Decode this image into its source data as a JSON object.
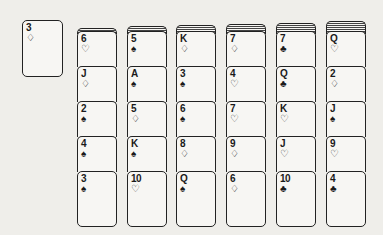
{
  "waste": {
    "card": {
      "rank": "3",
      "suit": "♢",
      "suit_name": "diamonds"
    }
  },
  "tableau": [
    {
      "hidden_count": 1,
      "cards": [
        {
          "rank": "6",
          "suit": "♡",
          "suit_name": "hearts"
        },
        {
          "rank": "J",
          "suit": "♢",
          "suit_name": "diamonds"
        },
        {
          "rank": "2",
          "suit": "♠",
          "suit_name": "spades"
        },
        {
          "rank": "4",
          "suit": "♠",
          "suit_name": "spades"
        },
        {
          "rank": "3",
          "suit": "♠",
          "suit_name": "spades"
        }
      ]
    },
    {
      "hidden_count": 2,
      "cards": [
        {
          "rank": "5",
          "suit": "♠",
          "suit_name": "spades"
        },
        {
          "rank": "A",
          "suit": "♠",
          "suit_name": "spades"
        },
        {
          "rank": "5",
          "suit": "♢",
          "suit_name": "diamonds"
        },
        {
          "rank": "K",
          "suit": "♠",
          "suit_name": "spades"
        },
        {
          "rank": "10",
          "suit": "♡",
          "suit_name": "hearts"
        }
      ]
    },
    {
      "hidden_count": 3,
      "cards": [
        {
          "rank": "K",
          "suit": "♢",
          "suit_name": "diamonds"
        },
        {
          "rank": "3",
          "suit": "♠",
          "suit_name": "spades"
        },
        {
          "rank": "6",
          "suit": "♠",
          "suit_name": "spades"
        },
        {
          "rank": "8",
          "suit": "♢",
          "suit_name": "diamonds"
        },
        {
          "rank": "Q",
          "suit": "♠",
          "suit_name": "spades"
        }
      ]
    },
    {
      "hidden_count": 4,
      "cards": [
        {
          "rank": "7",
          "suit": "♢",
          "suit_name": "diamonds"
        },
        {
          "rank": "4",
          "suit": "♡",
          "suit_name": "hearts"
        },
        {
          "rank": "7",
          "suit": "♡",
          "suit_name": "hearts"
        },
        {
          "rank": "9",
          "suit": "♢",
          "suit_name": "diamonds"
        },
        {
          "rank": "6",
          "suit": "♢",
          "suit_name": "diamonds"
        }
      ]
    },
    {
      "hidden_count": 5,
      "cards": [
        {
          "rank": "7",
          "suit": "♣",
          "suit_name": "clubs"
        },
        {
          "rank": "Q",
          "suit": "♣",
          "suit_name": "clubs"
        },
        {
          "rank": "K",
          "suit": "♡",
          "suit_name": "hearts"
        },
        {
          "rank": "J",
          "suit": "♡",
          "suit_name": "hearts"
        },
        {
          "rank": "10",
          "suit": "♣",
          "suit_name": "clubs"
        }
      ]
    },
    {
      "hidden_count": 6,
      "cards": [
        {
          "rank": "Q",
          "suit": "♡",
          "suit_name": "hearts"
        },
        {
          "rank": "2",
          "suit": "♢",
          "suit_name": "diamonds"
        },
        {
          "rank": "J",
          "suit": "♠",
          "suit_name": "spades"
        },
        {
          "rank": "9",
          "suit": "♡",
          "suit_name": "hearts"
        },
        {
          "rank": "4",
          "suit": "♣",
          "suit_name": "clubs"
        }
      ]
    }
  ]
}
